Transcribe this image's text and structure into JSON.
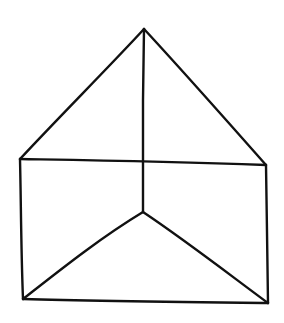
{
  "figure": {
    "background": "#ffffff",
    "stroke_color": "#111111",
    "stroke_width": 2.4
  },
  "vertices": {
    "apex": [
      144,
      29
    ],
    "top_left": [
      20,
      159
    ],
    "top_right": [
      266,
      165
    ],
    "center": [
      143,
      212
    ],
    "bottom_left": [
      23,
      299
    ],
    "bottom_right": [
      268,
      303
    ],
    "mid_top": [
      143,
      161
    ]
  },
  "edges": [
    {
      "name": "roof-left-edge",
      "d": "M144 29 C 110 66, 58 118, 20 159"
    },
    {
      "name": "roof-right-edge",
      "d": "M144 29 C 182 70, 228 122, 266 165"
    },
    {
      "name": "vertical-center-edge",
      "d": "M144 29 L 143 100 L 143 161 L 143 212"
    },
    {
      "name": "horizontal-top-edge",
      "d": "M20 159 C 80 160, 160 161, 266 165"
    },
    {
      "name": "left-side-edge",
      "d": "M20 159 C 21 200, 21 250, 23 299"
    },
    {
      "name": "right-side-edge",
      "d": "M266 165 C 267 210, 267 260, 268 303"
    },
    {
      "name": "bottom-edge",
      "d": "M23 299 C 90 301, 180 302, 268 303"
    },
    {
      "name": "inner-left-diagonal",
      "d": "M143 212 C 100 238, 60 270, 23 299"
    },
    {
      "name": "inner-right-diagonal",
      "d": "M143 212 C 185 240, 230 275, 268 303"
    }
  ]
}
